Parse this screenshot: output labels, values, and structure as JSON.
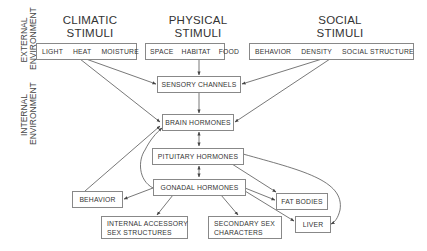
{
  "headers": {
    "climatic": [
      "CLIMATIC",
      "STIMULI"
    ],
    "physical": [
      "PHYSICAL",
      "STIMULI"
    ],
    "social": [
      "SOCIAL",
      "STIMULI"
    ]
  },
  "side_labels": {
    "external": [
      "EXTERNAL",
      "ENVIRONMENT"
    ],
    "internal": [
      "INTERNAL",
      "ENVIRONMENT"
    ]
  },
  "stimuli": {
    "climatic": [
      "LIGHT",
      "HEAT",
      "MOISTURE"
    ],
    "physical": [
      "SPACE",
      "HABITAT",
      "FOOD"
    ],
    "social": [
      "BEHAVIOR",
      "DENSITY",
      "SOCIAL STRUCTURE"
    ]
  },
  "nodes": {
    "sensory": "SENSORY CHANNELS",
    "brain": "BRAIN HORMONES",
    "pituitary": "PITUITARY HORMONES",
    "gonadal": "GONADAL HORMONES",
    "behavior": "BEHAVIOR",
    "internal_accessory": [
      "INTERNAL ACCESSORY",
      "SEX STRUCTURES"
    ],
    "secondary_sex": [
      "SECONDARY SEX",
      "CHARACTERS"
    ],
    "fat_bodies": "FAT BODIES",
    "liver": "LIVER"
  },
  "edges": [
    {
      "from": "heat",
      "to": "sensory-channels"
    },
    {
      "from": "heat",
      "to": "brain-hormones"
    },
    {
      "from": "habitat",
      "to": "sensory-channels"
    },
    {
      "from": "density",
      "to": "sensory-channels"
    },
    {
      "from": "social-structure",
      "to": "brain-hormones"
    },
    {
      "from": "sensory-channels",
      "to": "brain-hormones"
    },
    {
      "from": "brain-hormones",
      "to": "pituitary-hormones",
      "bidirectional": true
    },
    {
      "from": "pituitary-hormones",
      "to": "gonadal-hormones",
      "bidirectional": true
    },
    {
      "from": "behavior",
      "to": "brain-hormones"
    },
    {
      "from": "gonadal-hormones",
      "to": "brain-hormones"
    },
    {
      "from": "gonadal-hormones",
      "to": "behavior"
    },
    {
      "from": "gonadal-hormones",
      "to": "internal-accessory-sex-structures"
    },
    {
      "from": "gonadal-hormones",
      "to": "secondary-sex-characters"
    },
    {
      "from": "gonadal-hormones",
      "to": "fat-bodies"
    },
    {
      "from": "gonadal-hormones",
      "to": "liver"
    },
    {
      "from": "pituitary-hormones",
      "to": "fat-bodies"
    },
    {
      "from": "pituitary-hormones",
      "to": "liver"
    }
  ]
}
